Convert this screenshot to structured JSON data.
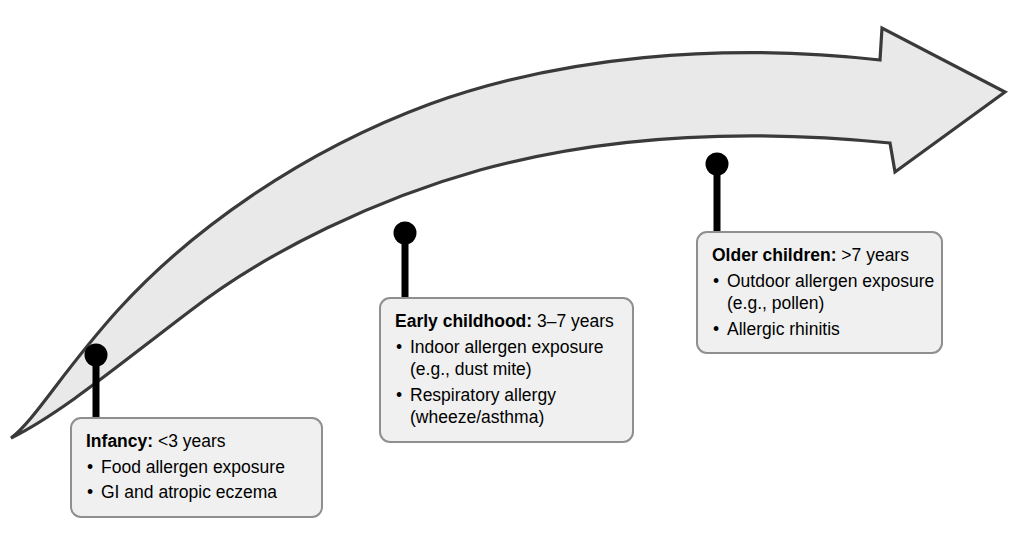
{
  "diagram": {
    "arrow": {
      "name": "upward-progression-arrow",
      "fill": "#e9e9e9",
      "stroke": "#3a3a3a",
      "direction": "rising left-to-right"
    },
    "connector_color": "#000000",
    "box_fill": "#f0f0f0",
    "box_border": "#8f8f8f"
  },
  "stages": [
    {
      "id": "infancy",
      "term": "Infancy:",
      "age": " <3 years",
      "bullets": [
        {
          "text": "Food allergen exposure",
          "cont": ""
        },
        {
          "text": "GI and atropic eczema",
          "cont": ""
        }
      ],
      "marker": {
        "x": 96,
        "y": 355
      }
    },
    {
      "id": "early-childhood",
      "term": "Early childhood:",
      "age": " 3–7 years",
      "bullets": [
        {
          "text": "Indoor allergen exposure",
          "cont": "(e.g., dust mite)"
        },
        {
          "text": "Respiratory allergy",
          "cont": "(wheeze/asthma)"
        }
      ],
      "marker": {
        "x": 405,
        "y": 233
      }
    },
    {
      "id": "older-children",
      "term": "Older children:",
      "age": " >7 years",
      "bullets": [
        {
          "text": "Outdoor allergen exposure",
          "cont": "(e.g., pollen)"
        },
        {
          "text": "Allergic rhinitis",
          "cont": ""
        }
      ],
      "marker": {
        "x": 717,
        "y": 164
      }
    }
  ]
}
